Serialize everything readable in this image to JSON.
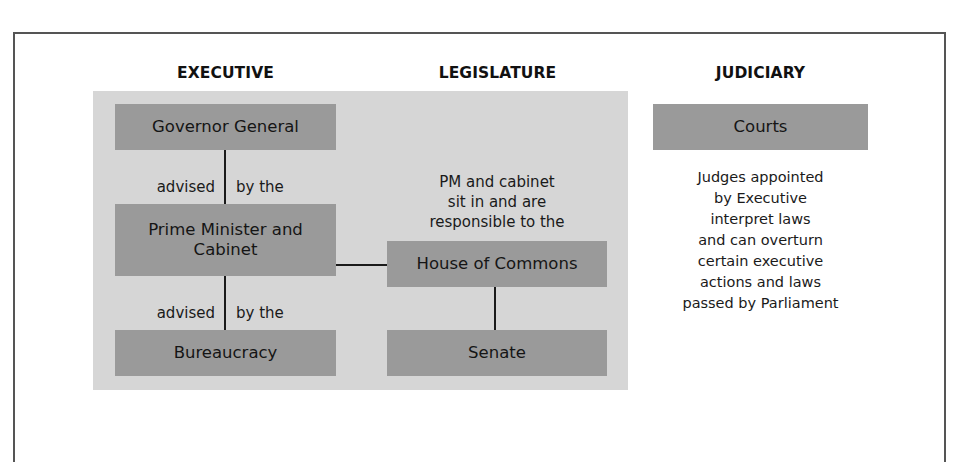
{
  "headings": {
    "executive": "EXECUTIVE",
    "legislature": "LEGISLATURE",
    "judiciary": "JUDICIARY"
  },
  "executive": {
    "governor_general": "Governor General",
    "link1": {
      "left": "advised",
      "right": "by the"
    },
    "pm_cabinet_line1": "Prime Minister and",
    "pm_cabinet_line2": "Cabinet",
    "link2": {
      "left": "advised",
      "right": "by the"
    },
    "bureaucracy": "Bureaucracy"
  },
  "legislature": {
    "note_lines": [
      "PM and cabinet",
      "sit in and are",
      "responsible to the"
    ],
    "house_of_commons": "House of Commons",
    "senate": "Senate"
  },
  "judiciary": {
    "courts": "Courts",
    "note_lines": [
      "Judges appointed",
      "by Executive",
      "interpret laws",
      "and can overturn",
      "certain executive",
      "actions and laws",
      "passed by Parliament"
    ]
  },
  "colors": {
    "panel_bg": "#d6d6d6",
    "box_bg": "#9a9a9a",
    "line": "#1a1a1a",
    "frame": "#555555"
  }
}
